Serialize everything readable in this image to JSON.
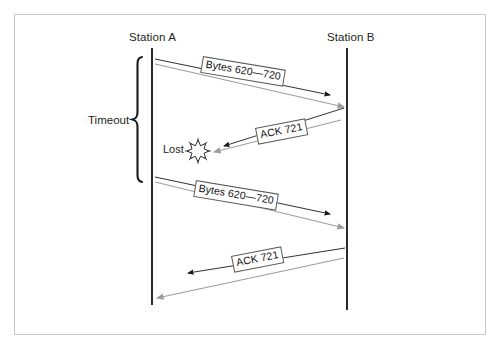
{
  "diagram": {
    "frame": {
      "border_color": "#c9c9c9"
    },
    "participants": [
      {
        "id": "station-a",
        "label": "Station A",
        "x": 152,
        "lifeline_top": 48,
        "lifeline_bottom": 305
      },
      {
        "id": "station-b",
        "label": "Station B",
        "x": 347,
        "lifeline_top": 48,
        "lifeline_bottom": 310
      }
    ],
    "messages": [
      {
        "id": "bytes-1",
        "label": "Bytes 620—720",
        "direction": "a-to-b",
        "from_x": 155,
        "from_y": 59,
        "to_x": 348,
        "to_y": 107,
        "arrow_color": "#9e9e9e",
        "accent_color": "#1a1a1a",
        "delivered": true
      },
      {
        "id": "ack-1",
        "label": "ACK 721",
        "direction": "b-to-a",
        "from_x": 344,
        "from_y": 108,
        "to_x": 212,
        "to_y": 152,
        "arrow_color": "#9e9e9e",
        "accent_color": "#1a1a1a",
        "delivered": false,
        "loss_marker": {
          "label": "Lost",
          "x": 198,
          "y": 151
        }
      },
      {
        "id": "bytes-2",
        "label": "Bytes 620—720",
        "direction": "a-to-b",
        "from_x": 155,
        "from_y": 177,
        "to_x": 348,
        "to_y": 228,
        "arrow_color": "#9e9e9e",
        "accent_color": "#1a1a1a",
        "delivered": true
      },
      {
        "id": "ack-2",
        "label": "ACK 721",
        "direction": "b-to-a",
        "from_x": 345,
        "from_y": 248,
        "to_x": 154,
        "to_y": 298,
        "arrow_color": "#9e9e9e",
        "accent_color": "#1a1a1a",
        "delivered": true
      }
    ],
    "annotations": {
      "timeout": {
        "label": "Timeout",
        "brace_top": 57,
        "brace_bottom": 182,
        "brace_x": 137,
        "color": "#1a1a1a"
      }
    },
    "colors": {
      "line_gray": "#9e9e9e",
      "line_black": "#1a1a1a",
      "text": "#231f20",
      "frame": "#c9c9c9",
      "background": "#ffffff"
    }
  }
}
